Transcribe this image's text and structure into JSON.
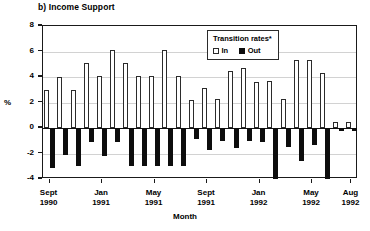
{
  "chart_data": {
    "type": "bar",
    "title": "b) Income Support",
    "subtitle": "",
    "xlabel": "Month",
    "ylabel": "%",
    "ylim": [
      -4,
      8
    ],
    "yticks": [
      -4,
      -2,
      0,
      2,
      4,
      6,
      8
    ],
    "ytick_labels": [
      "-4",
      "-2",
      "0",
      "2",
      "4",
      "6",
      "8"
    ],
    "grid": true,
    "legend": {
      "title": "Transition rates*",
      "position": "top-right",
      "entries": [
        {
          "label": "In",
          "style": "open",
          "color": "#ffffff"
        },
        {
          "label": "Out",
          "style": "filled",
          "color": "#0d0d0d"
        }
      ]
    },
    "xtick_labels": [
      {
        "month": "Sept",
        "year": "1990"
      },
      {
        "month": "Jan",
        "year": "1991"
      },
      {
        "month": "May",
        "year": "1991"
      },
      {
        "month": "Sept",
        "year": "1991"
      },
      {
        "month": "Jan",
        "year": "1992"
      },
      {
        "month": "May",
        "year": "1992"
      },
      {
        "month": "Aug",
        "year": "1992"
      }
    ],
    "xtick_positions": [
      0,
      4,
      8,
      12,
      16,
      20,
      23
    ],
    "categories": [
      "Sept 1990",
      "Oct 1990",
      "Nov 1990",
      "Dec 1990",
      "Jan 1991",
      "Feb 1991",
      "Mar 1991",
      "Apr 1991",
      "May 1991",
      "Jun 1991",
      "Jul 1991",
      "Aug 1991",
      "Sept 1991",
      "Oct 1991",
      "Nov 1991",
      "Dec 1991",
      "Jan 1992",
      "Feb 1992",
      "Mar 1992",
      "Apr 1992",
      "May 1992",
      "Jun 1992",
      "Jul 1992",
      "Aug 1992"
    ],
    "series": [
      {
        "name": "In",
        "values": [
          3.0,
          4.0,
          3.0,
          5.1,
          4.1,
          6.1,
          5.1,
          4.1,
          4.1,
          6.1,
          4.1,
          2.2,
          3.1,
          2.3,
          4.5,
          4.7,
          3.6,
          3.7,
          2.3,
          5.3,
          5.3,
          4.3,
          0.5,
          0.5
        ]
      },
      {
        "name": "Out",
        "values": [
          -3.1,
          -2.1,
          -3.0,
          -1.1,
          -2.2,
          -1.1,
          -3.0,
          -3.0,
          -3.0,
          -3.0,
          -3.0,
          -0.9,
          -1.7,
          -1.0,
          -1.6,
          -1.0,
          -1.1,
          -4.0,
          -1.5,
          -2.6,
          -1.3,
          -4.0,
          -0.2,
          -0.2
        ]
      }
    ]
  }
}
